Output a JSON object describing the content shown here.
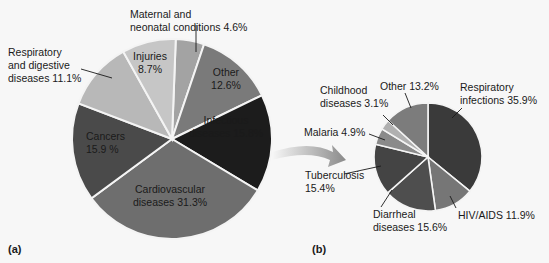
{
  "chart_data": [
    {
      "type": "pie",
      "panel_label": "(a)",
      "title": "",
      "start": "top",
      "direction": "clockwise",
      "slices": [
        {
          "name": "Maternal and neonatal conditions",
          "value": 4.6,
          "label_lines": [
            "Maternal and",
            "neonatal conditions 4.6%"
          ],
          "color": "#a3a3a3",
          "label_color": "#1a1a1a"
        },
        {
          "name": "Other",
          "value": 12.6,
          "label_lines": [
            "Other",
            "12.6%"
          ],
          "color": "#7a7a7a",
          "label_color": "#1a1a1a"
        },
        {
          "name": "Infectious diseases",
          "value": 15.8,
          "label_lines": [
            "Infectious",
            "diseases 15.8%"
          ],
          "color": "#1c1c1c",
          "label_color": "#ffffff"
        },
        {
          "name": "Cardiovascular diseases",
          "value": 31.3,
          "label_lines": [
            "Cardiovascular",
            "diseases 31.3%"
          ],
          "color": "#6e6e6e",
          "label_color": "#1a1a1a"
        },
        {
          "name": "Cancers",
          "value": 15.9,
          "label_lines": [
            "Cancers",
            "15.9 %"
          ],
          "color": "#4a4a4a",
          "label_color": "#1a1a1a"
        },
        {
          "name": "Respiratory and digestive diseases",
          "value": 11.1,
          "label_lines": [
            "Respiratory",
            "and digestive",
            "diseases 11.1%"
          ],
          "color": "#b8b8b8",
          "label_color": "#1a1a1a"
        },
        {
          "name": "Injuries",
          "value": 8.7,
          "label_lines": [
            "Injuries",
            "8.7%"
          ],
          "color": "#c6c6c6",
          "label_color": "#1a1a1a"
        }
      ]
    },
    {
      "type": "pie",
      "panel_label": "(b)",
      "title": "",
      "start": "top",
      "direction": "clockwise",
      "slices": [
        {
          "name": "Respiratory infections",
          "value": 35.9,
          "label_lines": [
            "Respiratory",
            "infections 35.9%"
          ],
          "color": "#3a3a3a",
          "label_color": "#1a1a1a"
        },
        {
          "name": "HIV/AIDS",
          "value": 11.9,
          "label_lines": [
            "HIV/AIDS 11.9%"
          ],
          "color": "#767676",
          "label_color": "#1a1a1a"
        },
        {
          "name": "Diarrheal diseases",
          "value": 15.6,
          "label_lines": [
            "Diarrheal",
            "diseases 15.6%"
          ],
          "color": "#4e4e4e",
          "label_color": "#1a1a1a"
        },
        {
          "name": "Tuberculosis",
          "value": 15.4,
          "label_lines": [
            "Tuberculosis",
            "15.4%"
          ],
          "color": "#444444",
          "label_color": "#1a1a1a"
        },
        {
          "name": "Malaria",
          "value": 4.9,
          "label_lines": [
            "Malaria 4.9%"
          ],
          "color": "#8a8a8a",
          "label_color": "#1a1a1a"
        },
        {
          "name": "Childhood diseases",
          "value": 3.1,
          "label_lines": [
            "Childhood",
            "diseases 3.1%"
          ],
          "color": "#b0b0b0",
          "label_color": "#1a1a1a"
        },
        {
          "name": "Other",
          "value": 13.2,
          "label_lines": [
            "Other 13.2%"
          ],
          "color": "#7c7c7c",
          "label_color": "#1a1a1a"
        }
      ]
    }
  ],
  "connector": {
    "kind": "arrow",
    "from": "Infectious diseases",
    "to": "(b)"
  }
}
